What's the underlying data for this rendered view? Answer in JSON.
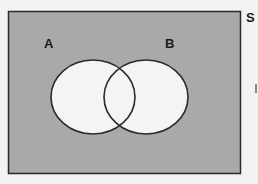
{
  "diagram": {
    "type": "venn",
    "universal_set_label": "S",
    "sets": [
      {
        "label": "A"
      },
      {
        "label": "B"
      }
    ],
    "colors": {
      "universe_fill": "#a9a9a9",
      "circle_fill": "#f4f4f4",
      "stroke": "#2a2a2a",
      "background": "#f2f2f2"
    }
  }
}
